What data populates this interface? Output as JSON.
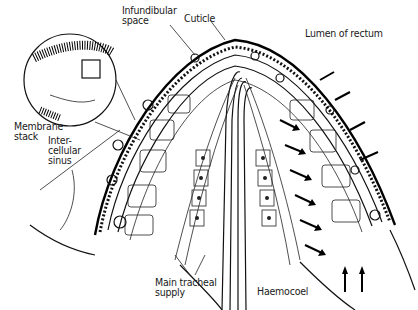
{
  "figure": {
    "type": "anatomical line drawing"
  },
  "labels": {
    "infundibular_space": "Infundibular\nspace",
    "cuticle": "Cuticle",
    "lumen_of_rectum": "Lumen of rectum",
    "membrane_stack": "Membrane\nstack",
    "intercellular_sinus": "Inter-\ncellular\nsinus",
    "main_tracheal_supply": "Main tracheal\nsupply",
    "haemocoel": "Haemocoel"
  }
}
